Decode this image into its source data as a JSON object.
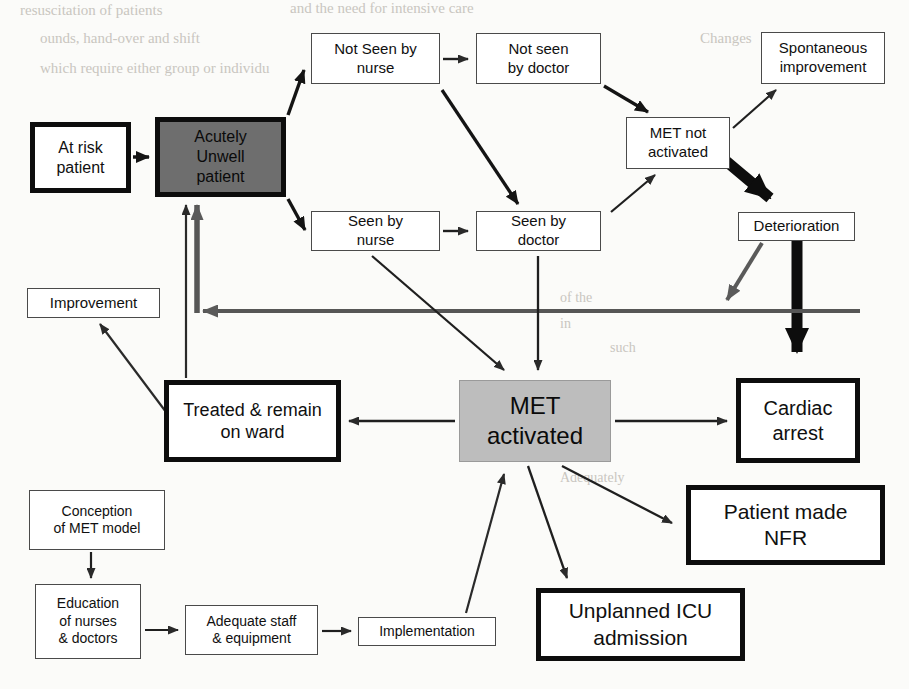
{
  "diagram": {
    "type": "flowchart",
    "nodes": [
      {
        "id": "at_risk",
        "label": "At risk\npatient",
        "style": "thick",
        "x": 30,
        "y": 122,
        "w": 101,
        "h": 71,
        "font": 16
      },
      {
        "id": "acutely_unwell",
        "label": "Acutely\nUnwell\npatient",
        "style": "grey-dark",
        "x": 155,
        "y": 117,
        "w": 131,
        "h": 80,
        "font": 16
      },
      {
        "id": "not_seen_nurse",
        "label": "Not Seen by\nnurse",
        "style": "thin",
        "x": 311,
        "y": 33,
        "w": 129,
        "h": 51,
        "font": 15
      },
      {
        "id": "not_seen_doc",
        "label": "Not seen\nby doctor",
        "style": "thin",
        "x": 476,
        "y": 33,
        "w": 125,
        "h": 51,
        "font": 15
      },
      {
        "id": "seen_nurse",
        "label": "Seen by\nnurse",
        "style": "thin",
        "x": 311,
        "y": 211,
        "w": 129,
        "h": 40,
        "font": 15
      },
      {
        "id": "seen_doc",
        "label": "Seen by\ndoctor",
        "style": "thin",
        "x": 476,
        "y": 211,
        "w": 125,
        "h": 40,
        "font": 15
      },
      {
        "id": "met_not_act",
        "label": "MET not\nactivated",
        "style": "thin",
        "x": 626,
        "y": 117,
        "w": 104,
        "h": 52,
        "font": 15
      },
      {
        "id": "spontaneous",
        "label": "Spontaneous\nimprovement",
        "style": "thin",
        "x": 761,
        "y": 32,
        "w": 124,
        "h": 52,
        "font": 15
      },
      {
        "id": "deterioration",
        "label": "Deterioration",
        "style": "thin",
        "x": 738,
        "y": 212,
        "w": 117,
        "h": 29,
        "font": 15
      },
      {
        "id": "improvement",
        "label": "Improvement",
        "style": "thin",
        "x": 27,
        "y": 288,
        "w": 133,
        "h": 30,
        "font": 15
      },
      {
        "id": "treated_ward",
        "label": "Treated & remain\non ward",
        "style": "thick",
        "x": 164,
        "y": 380,
        "w": 177,
        "h": 82,
        "font": 18
      },
      {
        "id": "met_activated",
        "label": "MET\nactivated",
        "style": "grey-light",
        "x": 459,
        "y": 380,
        "w": 152,
        "h": 82,
        "font": 24
      },
      {
        "id": "cardiac_arrest",
        "label": "Cardiac\narrest",
        "style": "thick",
        "x": 736,
        "y": 378,
        "w": 124,
        "h": 85,
        "font": 20
      },
      {
        "id": "nfr",
        "label": "Patient made\nNFR",
        "style": "thick",
        "x": 686,
        "y": 485,
        "w": 199,
        "h": 80,
        "font": 21
      },
      {
        "id": "icu",
        "label": "Unplanned ICU\nadmission",
        "style": "thick",
        "x": 536,
        "y": 588,
        "w": 209,
        "h": 73,
        "font": 21
      },
      {
        "id": "conception",
        "label": "Conception\nof MET model",
        "style": "thin",
        "x": 29,
        "y": 490,
        "w": 136,
        "h": 60,
        "font": 14
      },
      {
        "id": "education",
        "label": "Education\nof nurses\n& doctors",
        "style": "thin",
        "x": 35,
        "y": 584,
        "w": 106,
        "h": 75,
        "font": 14
      },
      {
        "id": "adequate",
        "label": "Adequate staff\n& equipment",
        "style": "thin",
        "x": 185,
        "y": 605,
        "w": 133,
        "h": 50,
        "font": 14
      },
      {
        "id": "implementation",
        "label": "Implementation",
        "style": "thin",
        "x": 358,
        "y": 617,
        "w": 138,
        "h": 29,
        "font": 14
      }
    ],
    "edges": [
      {
        "from": "at_risk",
        "to": "acutely_unwell",
        "weight": "medium"
      },
      {
        "from": "acutely_unwell",
        "to": "not_seen_nurse",
        "weight": "medium"
      },
      {
        "from": "acutely_unwell",
        "to": "seen_nurse",
        "weight": "medium"
      },
      {
        "from": "not_seen_nurse",
        "to": "not_seen_doc",
        "weight": "thin"
      },
      {
        "from": "seen_nurse",
        "to": "seen_doc",
        "weight": "thin"
      },
      {
        "from": "not_seen_nurse",
        "to": "seen_doc",
        "weight": "medium"
      },
      {
        "from": "not_seen_doc",
        "to": "met_not_act",
        "weight": "medium"
      },
      {
        "from": "seen_doc",
        "to": "met_not_act",
        "weight": "thin"
      },
      {
        "from": "met_not_act",
        "to": "spontaneous",
        "weight": "thin"
      },
      {
        "from": "met_not_act",
        "to": "deterioration",
        "weight": "heavy"
      },
      {
        "from": "deterioration",
        "to": "cardiac_arrest",
        "weight": "heavy"
      },
      {
        "from": "deterioration",
        "to": "acutely_unwell",
        "weight": "heavy-feedback"
      },
      {
        "from": "seen_nurse",
        "to": "met_activated",
        "weight": "thin"
      },
      {
        "from": "seen_doc",
        "to": "met_activated",
        "weight": "thin"
      },
      {
        "from": "met_activated",
        "to": "treated_ward",
        "weight": "thin"
      },
      {
        "from": "met_activated",
        "to": "cardiac_arrest",
        "weight": "thin"
      },
      {
        "from": "met_activated",
        "to": "nfr",
        "weight": "thin"
      },
      {
        "from": "met_activated",
        "to": "icu",
        "weight": "thin"
      },
      {
        "from": "treated_ward",
        "to": "acutely_unwell",
        "weight": "thin"
      },
      {
        "from": "treated_ward",
        "to": "improvement",
        "weight": "thin"
      },
      {
        "from": "conception",
        "to": "education",
        "weight": "thin"
      },
      {
        "from": "education",
        "to": "adequate",
        "weight": "thin"
      },
      {
        "from": "adequate",
        "to": "implementation",
        "weight": "thin"
      },
      {
        "from": "implementation",
        "to": "met_activated",
        "weight": "thin"
      }
    ]
  },
  "background_text": {
    "lines": [
      {
        "text": "resuscitation of patients",
        "x": 20,
        "y": 2,
        "size": 15
      },
      {
        "text": "and the need for intensive care",
        "x": 290,
        "y": 0,
        "size": 15
      },
      {
        "text": "ounds, hand-over and shift",
        "x": 40,
        "y": 30,
        "size": 15
      },
      {
        "text": "Changes",
        "x": 700,
        "y": 30,
        "size": 15
      },
      {
        "text": "which require either group or individu",
        "x": 40,
        "y": 60,
        "size": 15
      },
      {
        "text": "of the",
        "x": 560,
        "y": 290,
        "size": 14
      },
      {
        "text": "in",
        "x": 560,
        "y": 316,
        "size": 14
      },
      {
        "text": "such",
        "x": 610,
        "y": 340,
        "size": 14
      },
      {
        "text": "Adequately",
        "x": 560,
        "y": 470,
        "size": 14
      }
    ]
  },
  "colors": {
    "ink": "#101010",
    "node_fill": "#ffffff",
    "grey_dark": "#6e6e6e",
    "grey_light": "#bdbdbd",
    "page": "#fbfbf9",
    "bleed": "#c9c6c0"
  }
}
